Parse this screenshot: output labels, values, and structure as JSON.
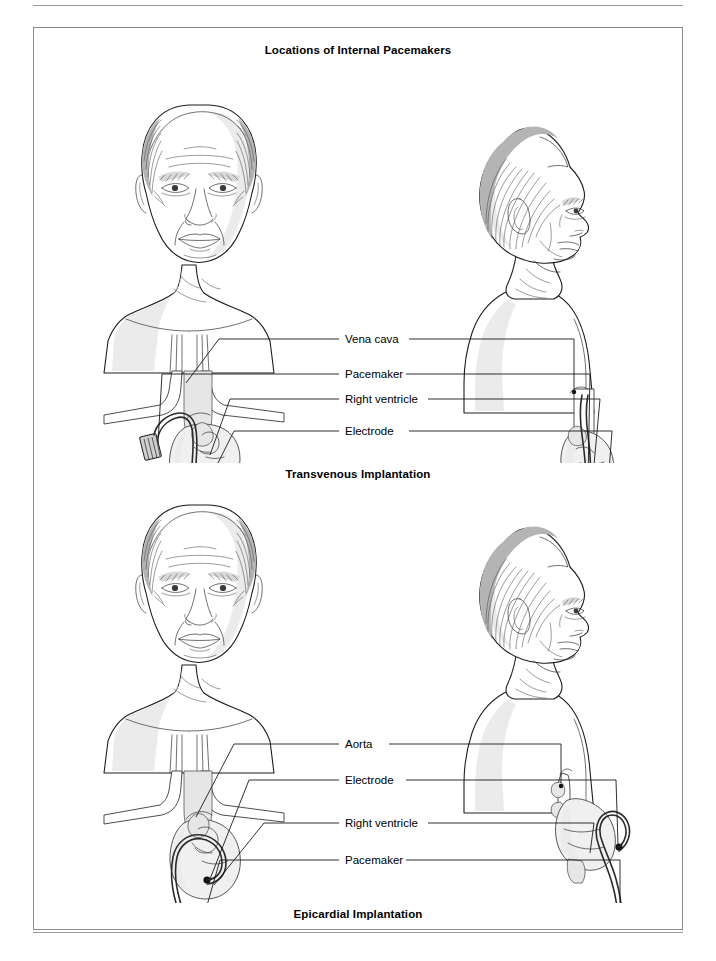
{
  "page": {
    "background_color": "#ffffff",
    "rule_color": "#9a9a9a",
    "frame_color": "#8c8c8c"
  },
  "figure": {
    "title": "Locations of Internal Pacemakers",
    "caption_upper": "Transvenous Implantation",
    "caption_lower": "Epicardial Implantation"
  },
  "upper_panel": {
    "name": "transvenous-implantation-diagram",
    "views": [
      {
        "id": "anterior",
        "description": "Anterior view of head, neck and chest"
      },
      {
        "id": "lateral",
        "description": "Right lateral profile view of head, neck and chest"
      }
    ],
    "labels": [
      {
        "text": "Vena cava"
      },
      {
        "text": "Pacemaker"
      },
      {
        "text": "Right ventricle"
      },
      {
        "text": "Electrode"
      }
    ]
  },
  "lower_panel": {
    "name": "epicardial-implantation-diagram",
    "views": [
      {
        "id": "anterior",
        "description": "Anterior view of head, neck and chest"
      },
      {
        "id": "lateral",
        "description": "Right lateral profile view of head, neck and chest"
      }
    ],
    "labels": [
      {
        "text": "Aorta"
      },
      {
        "text": "Electrode"
      },
      {
        "text": "Right ventricle"
      },
      {
        "text": "Pacemaker"
      }
    ]
  }
}
